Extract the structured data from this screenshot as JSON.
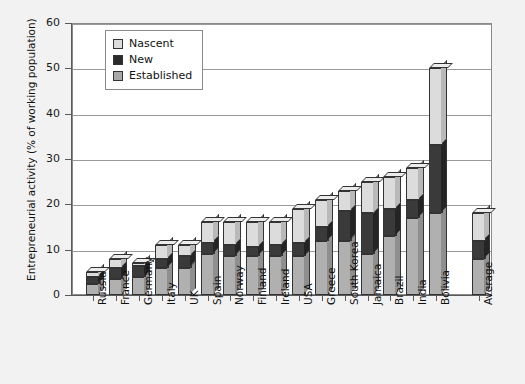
{
  "chart_data": {
    "type": "bar",
    "stacked": true,
    "title": "",
    "xlabel": "",
    "ylabel": "Entrepreneurial activity (% of working population)",
    "ylim": [
      0,
      60
    ],
    "yticks": [
      0,
      10,
      20,
      30,
      40,
      50,
      60
    ],
    "grid": true,
    "legend_position": "top-left",
    "categories": [
      "Russia",
      "France",
      "Germany",
      "Italy",
      "UK",
      "Spain",
      "Norway",
      "Finland",
      "Ireland",
      "USA",
      "Greece",
      "South Korea",
      "Jamaica",
      "Brazil",
      "India",
      "Bolivia",
      "Average"
    ],
    "series": [
      {
        "name": "Established",
        "color": "#b0b0b0",
        "values": [
          2.5,
          3.5,
          4.0,
          6.0,
          6.0,
          9.0,
          8.5,
          8.5,
          8.5,
          8.5,
          12.0,
          12.0,
          9.0,
          13.0,
          17.0,
          18.0,
          8.0
        ]
      },
      {
        "name": "New",
        "color": "#3a3a3a",
        "values": [
          1.5,
          2.5,
          2.5,
          2.0,
          2.5,
          2.5,
          2.5,
          2.0,
          2.5,
          3.0,
          3.0,
          6.5,
          9.0,
          6.0,
          4.0,
          15.0,
          4.0
        ]
      },
      {
        "name": "Nascent",
        "color": "#dcdcdc",
        "values": [
          1.0,
          2.0,
          0.5,
          3.0,
          2.5,
          4.5,
          5.0,
          5.5,
          5.0,
          7.5,
          6.0,
          4.5,
          7.0,
          7.0,
          7.0,
          17.0,
          6.0
        ]
      }
    ],
    "totals": [
      5.0,
      8.0,
      7.0,
      11.0,
      11.0,
      16.0,
      16.0,
      16.0,
      16.0,
      19.0,
      21.0,
      23.0,
      25.0,
      26.0,
      28.0,
      50.0,
      18.0
    ]
  },
  "legend": {
    "items": [
      {
        "label": "Nascent",
        "swatch": "nascent-swatch"
      },
      {
        "label": "New",
        "swatch": "new-swatch"
      },
      {
        "label": "Established",
        "swatch": "established-swatch"
      }
    ]
  }
}
